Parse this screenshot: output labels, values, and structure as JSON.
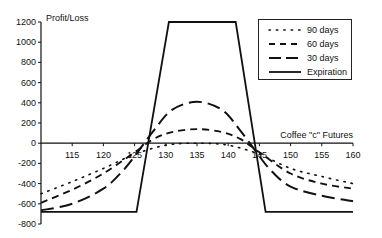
{
  "chart_data": {
    "type": "line",
    "title": "",
    "xlabel": "Coffee \"c\" Futures",
    "ylabel": "Profit/Loss",
    "xlim": [
      110,
      160
    ],
    "ylim": [
      -800,
      1200
    ],
    "x_ticks": [
      115,
      120,
      125,
      130,
      135,
      140,
      145,
      150,
      155,
      160
    ],
    "y_ticks": [
      1200,
      1000,
      800,
      600,
      400,
      200,
      0,
      -200,
      -400,
      -600,
      -800
    ],
    "grid": false,
    "legend_position": "upper right",
    "series": [
      {
        "name": "90 days",
        "style": "dotted",
        "x": [
          110,
          115,
          120,
          125,
          130,
          135,
          140,
          145,
          150,
          155,
          160
        ],
        "y": [
          -500,
          -380,
          -250,
          -110,
          -20,
          0,
          -20,
          -110,
          -250,
          -330,
          -400
        ]
      },
      {
        "name": "60 days",
        "style": "dashed",
        "x": [
          110,
          115,
          120,
          125,
          128,
          131,
          135,
          139,
          142,
          145,
          150,
          155,
          160
        ],
        "y": [
          -590,
          -460,
          -300,
          -90,
          40,
          110,
          140,
          110,
          40,
          -90,
          -300,
          -400,
          -450
        ]
      },
      {
        "name": "30 days",
        "style": "long-dashed",
        "x": [
          110,
          115,
          120,
          123,
          125,
          128,
          131,
          135,
          139,
          142,
          145,
          147,
          150,
          155,
          160
        ],
        "y": [
          -665,
          -600,
          -450,
          -280,
          -130,
          120,
          330,
          410,
          330,
          120,
          -130,
          -280,
          -430,
          -520,
          -575
        ]
      },
      {
        "name": "Expiration",
        "style": "solid",
        "x": [
          110,
          125.3,
          130.5,
          141.2,
          146,
          160
        ],
        "y": [
          -680,
          -680,
          1200,
          1200,
          -680,
          -680
        ]
      }
    ]
  },
  "legend": {
    "items": [
      {
        "label": "90 days"
      },
      {
        "label": "60 days"
      },
      {
        "label": "30 days"
      },
      {
        "label": "Expiration"
      }
    ]
  },
  "axes": {
    "y_title": "Profit/Loss",
    "x_title": "Coffee \"c\" Futures"
  }
}
